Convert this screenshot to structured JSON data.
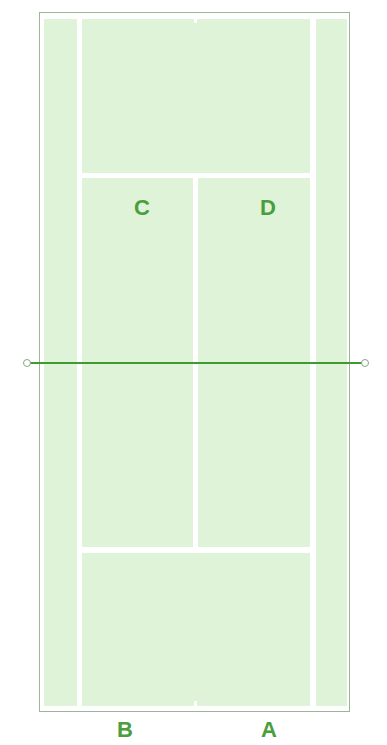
{
  "diagram": {
    "type": "tennis-court",
    "colors": {
      "court_fill": "#dff3d8",
      "lines": "#ffffff",
      "border": "#9fb59a",
      "net": "#3f9a34",
      "labels": "#4a9e3c"
    },
    "labels": {
      "C": "C",
      "D": "D",
      "B": "B",
      "A": "A"
    }
  }
}
